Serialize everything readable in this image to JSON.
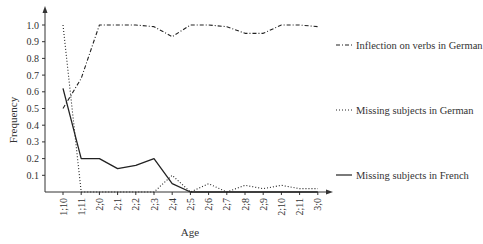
{
  "chart_data": {
    "type": "line",
    "title": "",
    "xlabel": "Age",
    "ylabel": "Frequency",
    "ylim": [
      0,
      1.0
    ],
    "grid": false,
    "legend_position": "right",
    "categories": [
      "1;10",
      "1;11",
      "2;0",
      "2;1",
      "2;2",
      "2;3",
      "2;4",
      "2;5",
      "2;6",
      "2;7",
      "2;8",
      "2;9",
      "2;10",
      "2;11",
      "3;0"
    ],
    "y_ticks": [
      "0.1",
      "0.2",
      "0.3",
      "0.4",
      "0.5",
      "0.6",
      "0.7",
      "0.8",
      "0.9",
      "1.0"
    ],
    "series": [
      {
        "name": "Inflection on verbs in German",
        "style": "dash-dot",
        "values": [
          0.5,
          0.68,
          1.0,
          1.0,
          1.0,
          0.99,
          0.93,
          1.0,
          1.0,
          0.99,
          0.95,
          0.95,
          1.0,
          1.0,
          0.99
        ]
      },
      {
        "name": "Missing subjects in German",
        "style": "dotted",
        "values": [
          1.0,
          0.0,
          0.0,
          0.0,
          0.0,
          0.0,
          0.1,
          0.0,
          0.05,
          0.0,
          0.04,
          0.02,
          0.04,
          0.02,
          0.02
        ]
      },
      {
        "name": "Missing subjects in French",
        "style": "solid",
        "values": [
          0.62,
          0.2,
          0.2,
          0.14,
          0.16,
          0.2,
          0.05,
          0.0,
          0.0,
          0.0,
          0.0,
          0.0,
          0.0,
          0.0,
          0.0
        ]
      }
    ]
  },
  "legend": {
    "items": [
      {
        "label": "Inflection on verbs in German"
      },
      {
        "label": "Missing subjects in German"
      },
      {
        "label": "Missing subjects in French"
      }
    ]
  },
  "axes": {
    "x_title": "Age",
    "y_title": "Frequency"
  },
  "colors": {
    "line": "#222222",
    "axis": "#333333",
    "background": "#ffffff"
  }
}
